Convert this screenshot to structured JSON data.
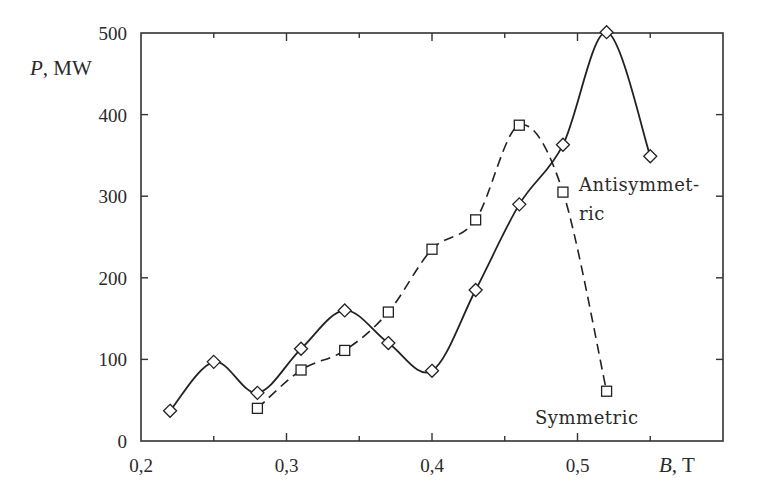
{
  "chart_data": {
    "type": "line",
    "title": "",
    "xlabel": "B, T",
    "xlabel_var": "B",
    "xlabel_unit": "T",
    "ylabel": "P, MW",
    "ylabel_var": "P",
    "ylabel_unit": "MW",
    "xlim": [
      0.2,
      0.6
    ],
    "ylim": [
      0,
      500
    ],
    "x_ticks": [
      0.2,
      0.25,
      0.3,
      0.35,
      0.4,
      0.45,
      0.5,
      0.55
    ],
    "x_tick_labels": [
      "0,2",
      "0,3",
      "0,4",
      "0,5"
    ],
    "x_tick_label_values": [
      0.2,
      0.3,
      0.4,
      0.5
    ],
    "y_ticks": [
      0,
      100,
      200,
      300,
      400,
      500
    ],
    "y_tick_labels": [
      "0",
      "100",
      "200",
      "300",
      "400",
      "500"
    ],
    "grid": false,
    "legend": "inline annotations",
    "series": [
      {
        "name": "Antisymmetric",
        "label_lines": [
          "Antisymmet-",
          "ric"
        ],
        "style": "solid",
        "marker": "diamond",
        "x": [
          0.22,
          0.25,
          0.28,
          0.31,
          0.34,
          0.37,
          0.4,
          0.43,
          0.46,
          0.49,
          0.52,
          0.55
        ],
        "values": [
          37,
          97,
          59,
          113,
          160,
          120,
          86,
          185,
          290,
          363,
          501,
          349
        ]
      },
      {
        "name": "Symmetric",
        "label_lines": [
          "Symmetric"
        ],
        "style": "dashed",
        "marker": "square",
        "x": [
          0.28,
          0.31,
          0.34,
          0.37,
          0.4,
          0.43,
          0.46,
          0.49,
          0.52
        ],
        "values": [
          40,
          87,
          111,
          158,
          235,
          271,
          387,
          305,
          61
        ]
      }
    ],
    "annotations": [
      {
        "text": "Antisymmet-",
        "x": 579,
        "y": 191
      },
      {
        "text": "ric",
        "x": 579,
        "y": 220
      },
      {
        "text": "Symmetric",
        "x": 535,
        "y": 424
      }
    ]
  }
}
